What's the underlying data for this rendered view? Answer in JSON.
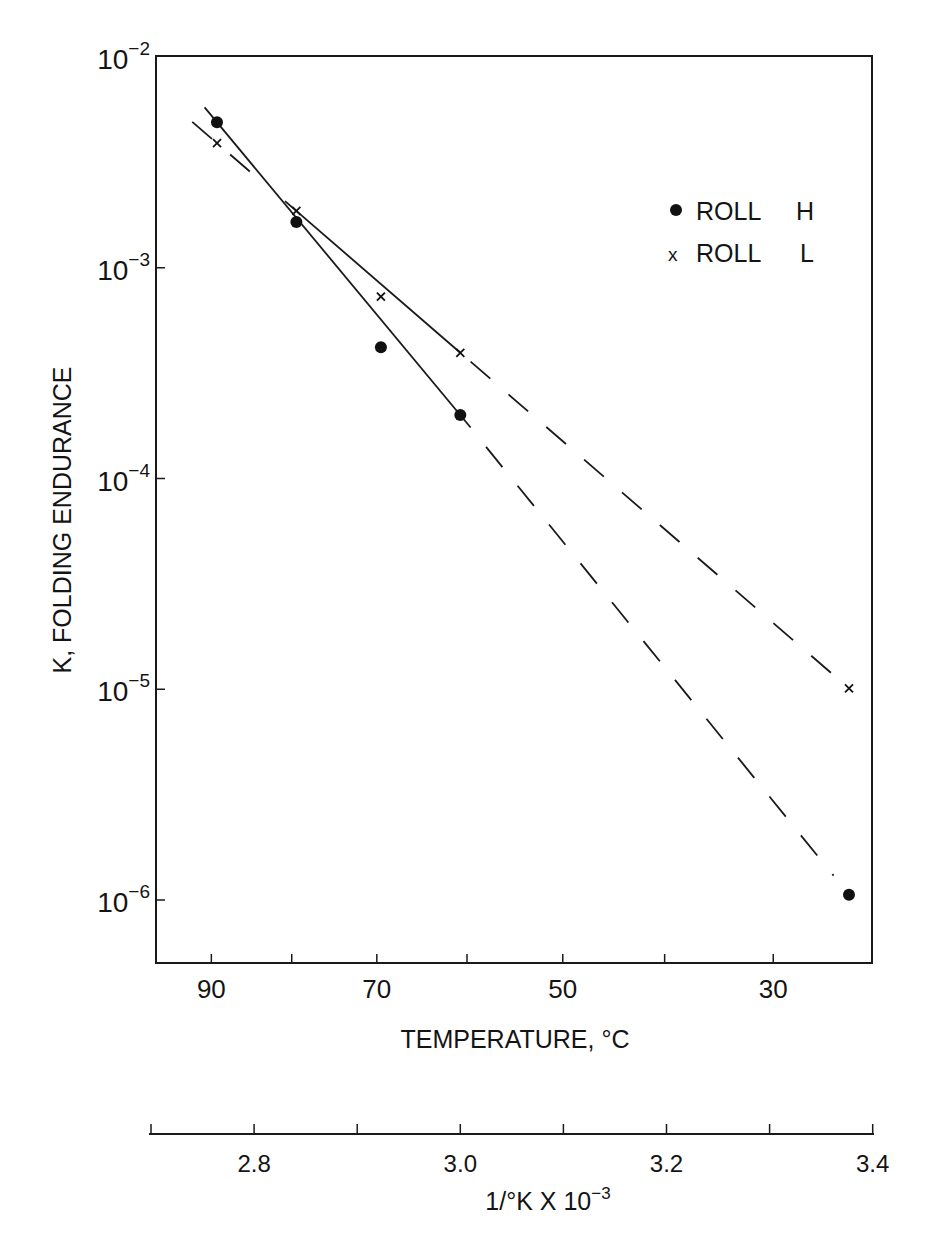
{
  "chart_data": {
    "type": "scatter",
    "title": "",
    "xlabel": "TEMPERATURE, °C",
    "xlabel_secondary": "1/°K X 10",
    "xlabel_secondary_exp": "−3",
    "ylabel": "K, FOLDING ENDURANCE",
    "yscale": "log",
    "ylim": [
      1e-06,
      0.01
    ],
    "y_ticks": [
      {
        "value": 0.01,
        "base": "10",
        "exp": "−2"
      },
      {
        "value": 0.001,
        "base": "10",
        "exp": "−3"
      },
      {
        "value": 0.0001,
        "base": "10",
        "exp": "−4"
      },
      {
        "value": 1e-05,
        "base": "10",
        "exp": "−5"
      },
      {
        "value": 1e-06,
        "base": "10",
        "exp": "−6"
      }
    ],
    "x_ticks_celsius": [
      {
        "value": 90,
        "label": "90"
      },
      {
        "value": 80,
        "label": ""
      },
      {
        "value": 70,
        "label": "70"
      },
      {
        "value": 60,
        "label": ""
      },
      {
        "value": 50,
        "label": "50"
      },
      {
        "value": 40,
        "label": ""
      },
      {
        "value": 30,
        "label": "30"
      }
    ],
    "x_ticks_inverse_kelvin": [
      {
        "value": 2.7,
        "label": ""
      },
      {
        "value": 2.8,
        "label": "2.8"
      },
      {
        "value": 2.9,
        "label": ""
      },
      {
        "value": 3.0,
        "label": "3.0"
      },
      {
        "value": 3.1,
        "label": ""
      },
      {
        "value": 3.2,
        "label": "3.2"
      },
      {
        "value": 3.3,
        "label": ""
      },
      {
        "value": 3.4,
        "label": "3.4"
      }
    ],
    "legend": {
      "position": "upper right",
      "entries": [
        {
          "marker": "●",
          "label": "ROLL",
          "code": "H"
        },
        {
          "marker": "x",
          "label": "ROLL",
          "code": "L"
        }
      ]
    },
    "grid": false,
    "series": [
      {
        "name": "ROLL H",
        "marker": "dot",
        "x_celsius": [
          89,
          79,
          69,
          60,
          23
        ],
        "x_inverse_kelvin": [
          2.764,
          2.841,
          2.923,
          3.0,
          3.377
        ],
        "values": [
          0.0049,
          0.00165,
          0.00042,
          0.0002,
          1.06e-06
        ],
        "fit": {
          "solid_from_invK": 2.752,
          "solid_to_invK": 3.01,
          "dashed_to_invK": 3.362
        }
      },
      {
        "name": "ROLL L",
        "marker": "x",
        "x_celsius": [
          89,
          79,
          69,
          60,
          23
        ],
        "x_inverse_kelvin": [
          2.764,
          2.841,
          2.923,
          3.0,
          3.377
        ],
        "values": [
          0.0039,
          0.00186,
          0.00073,
          0.000395,
          1.01e-05
        ],
        "fit": {
          "dashed_from_invK": 2.74,
          "solid_from_invK": 2.84,
          "solid_to_invK": 3.0,
          "dashed_to_invK": 3.362
        }
      }
    ]
  }
}
